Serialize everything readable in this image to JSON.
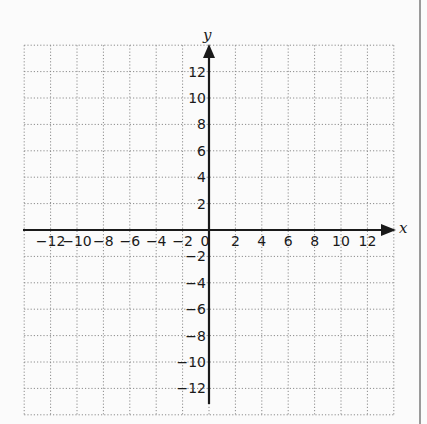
{
  "chart_data": {
    "type": "scatter",
    "title": "",
    "xlabel": "x",
    "ylabel": "y",
    "xlim": [
      -14,
      14
    ],
    "ylim": [
      -14,
      14
    ],
    "grid": true,
    "grid_style": "dotted",
    "grid_step": 2,
    "x_ticks": [
      -12,
      -10,
      -8,
      -6,
      -4,
      -2,
      0,
      2,
      4,
      6,
      8,
      10,
      12
    ],
    "y_ticks": [
      12,
      10,
      8,
      6,
      4,
      2,
      -2,
      -4,
      -6,
      -8,
      -10,
      -12
    ],
    "x_tick_labels": [
      "−12",
      "−10",
      "−8",
      "−6",
      "−4",
      "−2",
      "0",
      "2",
      "4",
      "6",
      "8",
      "10",
      "12"
    ],
    "y_tick_labels": [
      "12",
      "10",
      "8",
      "6",
      "4",
      "2",
      "−2",
      "−4",
      "−6",
      "−8",
      "−10",
      "−12"
    ],
    "series": [],
    "legend": null
  },
  "labels": {
    "x_axis": "x",
    "y_axis": "y",
    "origin": "0"
  },
  "colors": {
    "axis": "#1a1a1a",
    "grid": "#8c8c8c",
    "background": "#fbfbfb"
  }
}
